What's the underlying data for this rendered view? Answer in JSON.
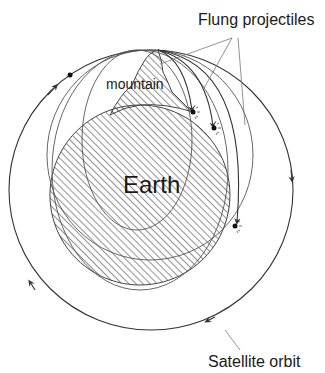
{
  "labels": {
    "flung_projectiles": "Flung projectiles",
    "mountain": "mountain",
    "earth": "Earth",
    "satellite_orbit": "Satellite orbit"
  },
  "colors": {
    "stroke": "#333333",
    "hatch": "#555555",
    "text": "#1a1a1a",
    "background": "#ffffff"
  },
  "elements": {
    "projectile_count": 3,
    "impact_points": 3,
    "satellite_dot": 1
  }
}
